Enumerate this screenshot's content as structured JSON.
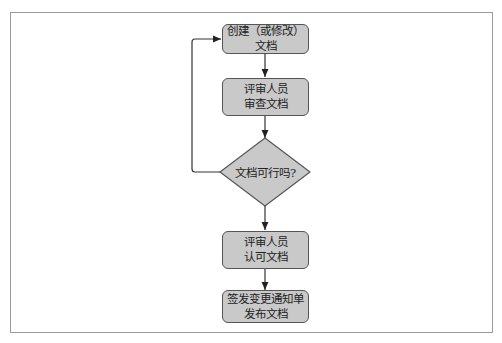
{
  "diagram": {
    "type": "flowchart",
    "nodes": [
      {
        "id": "create",
        "shape": "rounded-rect",
        "lines": [
          "创建（或修改）",
          "文档"
        ]
      },
      {
        "id": "review",
        "shape": "rounded-rect",
        "lines": [
          "评审人员",
          "审查文档"
        ]
      },
      {
        "id": "decision",
        "shape": "diamond",
        "lines": [
          "文档可行吗?"
        ]
      },
      {
        "id": "approve",
        "shape": "rounded-rect",
        "lines": [
          "评审人员",
          "认可文档"
        ]
      },
      {
        "id": "release",
        "shape": "rounded-rect",
        "lines": [
          "签发变更通知单",
          "发布文档"
        ]
      }
    ],
    "edges": [
      {
        "from": "create",
        "to": "review"
      },
      {
        "from": "review",
        "to": "decision"
      },
      {
        "from": "decision",
        "to": "approve",
        "label": ""
      },
      {
        "from": "decision",
        "to": "create",
        "label": "",
        "route": "left-loop"
      },
      {
        "from": "approve",
        "to": "release"
      }
    ],
    "colors": {
      "node_fill": "#c9c9c9",
      "node_border": "#555555",
      "line": "#333333",
      "frame": "#9a9a9a"
    }
  }
}
